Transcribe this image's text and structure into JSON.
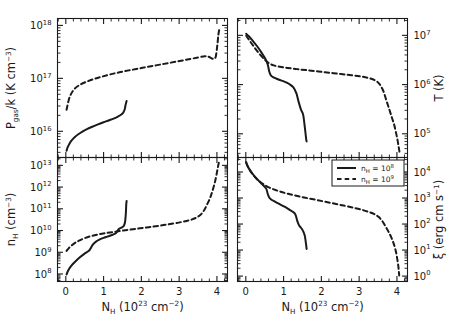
{
  "figure": {
    "title": "",
    "width": 457,
    "height": 332,
    "background": "#ffffff",
    "foreground": "#1a1a1a"
  },
  "legend": {
    "position": "bottom-right-panel-top-right",
    "entries": [
      {
        "style": "solid",
        "label": "n_H = 10^8",
        "label_base": "n",
        "label_sub": "H",
        "label_eq": " = 10",
        "label_exp": "8"
      },
      {
        "style": "dashed",
        "label": "n_H = 10^9",
        "label_base": "n",
        "label_sub": "H",
        "label_eq": " = 10",
        "label_exp": "9"
      }
    ]
  },
  "axes": {
    "x": {
      "label_main": "N",
      "label_sub": "H",
      "label_rest": " (10",
      "label_exp": "23",
      "label_unit": " cm",
      "label_unit_exp": "−2",
      "label_close": ")",
      "label_text": "N_H (10^23 cm^-2)",
      "ticks": [
        "0",
        "1",
        "2",
        "3",
        "4"
      ],
      "values": [
        0,
        1,
        2,
        3,
        4
      ],
      "min": -0.22,
      "max": 4.28,
      "scale": "linear"
    }
  },
  "chart_data": [
    {
      "id": "panel-pressure",
      "type": "line",
      "position": "top-left",
      "title": "",
      "xlabel": "N_H (10^23 cm^-2)",
      "ylabel": "P_gas/k (K cm^-3)",
      "ylabel_parts": {
        "base": "P",
        "sub": "gas",
        "mid": "/k (K cm",
        "exp": "−3",
        "close": ")"
      },
      "yscale": "log",
      "ylim": [
        3200000000000000.0,
        1.35e+18
      ],
      "yticks": [
        1e+16,
        1e+17,
        1e+18
      ],
      "ytick_labels": [
        "10^16",
        "10^17",
        "10^18"
      ],
      "ytick_exps": [
        "16",
        "17",
        "18"
      ],
      "grid": false,
      "series": [
        {
          "name": "n_H = 10^8",
          "style": "solid",
          "x": [
            0.02,
            0.05,
            0.1,
            0.16,
            0.24,
            0.33,
            0.44,
            0.56,
            0.7,
            0.85,
            1.0,
            1.15,
            1.28,
            1.38,
            1.46,
            1.52,
            1.56,
            1.58,
            1.6,
            1.61
          ],
          "y": [
            4300000000000000.0,
            5000000000000000.0,
            5900000000000000.0,
            6800000000000000.0,
            7800000000000000.0,
            8800000000000000.0,
            9900000000000000.0,
            1.1e+16,
            1.22e+16,
            1.35e+16,
            1.48e+16,
            1.62e+16,
            1.76e+16,
            1.9e+16,
            2.05e+16,
            2.25e+16,
            2.6e+16,
            3.1e+16,
            3.55e+16,
            3.75e+16
          ]
        },
        {
          "name": "n_H = 10^9",
          "style": "dashed",
          "x": [
            0.02,
            0.1,
            0.22,
            0.38,
            0.56,
            0.76,
            0.96,
            1.18,
            1.42,
            1.68,
            1.95,
            2.22,
            2.5,
            2.78,
            3.05,
            3.3,
            3.52,
            3.68,
            3.78,
            3.86,
            3.92,
            3.97,
            4.01,
            4.04,
            4.06
          ],
          "y": [
            2.55e+16,
            4.4e+16,
            6.2e+16,
            7.6e+16,
            8.7e+16,
            9.8e+16,
            1.08e+17,
            1.19e+17,
            1.3e+17,
            1.42e+17,
            1.54e+17,
            1.68e+17,
            1.82e+17,
            1.98e+17,
            2.15e+17,
            2.32e+17,
            2.5e+17,
            2.62e+17,
            2.55e+17,
            2.38e+17,
            2.35e+17,
            2.6e+17,
            4.2e+17,
            6.8e+17,
            8.2e+17
          ]
        }
      ]
    },
    {
      "id": "panel-temperature",
      "type": "line",
      "position": "top-right",
      "title": "",
      "xlabel": "N_H (10^23 cm^-2)",
      "ylabel": "T (K)",
      "ylabel_parts": {
        "base": "T (K)"
      },
      "yscale": "log",
      "ylim": [
        33000.0,
        22000000.0
      ],
      "yticks": [
        100000.0,
        1000000.0,
        10000000.0
      ],
      "ytick_labels": [
        "10^5",
        "10^6",
        "10^7"
      ],
      "ytick_exps": [
        "5",
        "6",
        "7"
      ],
      "grid": false,
      "series": [
        {
          "name": "n_H = 10^8",
          "style": "solid",
          "x": [
            0.01,
            0.08,
            0.18,
            0.3,
            0.42,
            0.52,
            0.58,
            0.62,
            0.66,
            0.72,
            0.8,
            0.9,
            1.02,
            1.14,
            1.26,
            1.34,
            1.4,
            1.46,
            1.52,
            1.57,
            1.6,
            1.61
          ],
          "y": [
            10800000.0,
            9600000.0,
            7800000.0,
            6000000.0,
            4400000.0,
            3300000.0,
            2550000.0,
            1850000.0,
            1550000.0,
            1420000.0,
            1330000.0,
            1240000.0,
            1150000.0,
            1040000.0,
            880000.0,
            660000.0,
            440000.0,
            310000.0,
            240000.0,
            120000.0,
            76000.0,
            70000.0
          ]
        },
        {
          "name": "n_H = 10^9",
          "style": "dashed",
          "x": [
            0.01,
            0.1,
            0.22,
            0.36,
            0.5,
            0.62,
            0.74,
            0.9,
            1.1,
            1.35,
            1.62,
            1.92,
            2.22,
            2.52,
            2.8,
            3.05,
            3.25,
            3.42,
            3.54,
            3.64,
            3.72,
            3.8,
            3.87,
            3.93,
            3.98,
            4.02,
            4.05,
            4.07
          ],
          "y": [
            9800000.0,
            7800000.0,
            5800000.0,
            4200000.0,
            3200000.0,
            2700000.0,
            2450000.0,
            2300000.0,
            2180000.0,
            2060000.0,
            1960000.0,
            1850000.0,
            1740000.0,
            1640000.0,
            1550000.0,
            1460000.0,
            1360000.0,
            1220000.0,
            1020000.0,
            740000.0,
            480000.0,
            310000.0,
            210000.0,
            150000.0,
            102000.0,
            72000.0,
            52000.0,
            42000.0
          ]
        }
      ]
    },
    {
      "id": "panel-density",
      "type": "line",
      "position": "bottom-left",
      "title": "",
      "xlabel": "N_H (10^23 cm^-2)",
      "ylabel": "n_H (cm^-3)",
      "ylabel_parts": {
        "base": "n",
        "sub": "H",
        "mid": " (cm",
        "exp": "−3",
        "close": ")"
      },
      "yscale": "log",
      "ylim": [
        45000000.0,
        23000000000000.0
      ],
      "yticks": [
        100000000.0,
        1000000000.0,
        10000000000.0,
        100000000000.0,
        1000000000000.0,
        10000000000000.0
      ],
      "ytick_labels": [
        "10^8",
        "10^9",
        "10^10",
        "10^11",
        "10^12",
        "10^13"
      ],
      "ytick_exps": [
        "8",
        "9",
        "10",
        "11",
        "12",
        "13"
      ],
      "grid": false,
      "series": [
        {
          "name": "n_H = 10^8",
          "style": "solid",
          "x": [
            0.02,
            0.05,
            0.1,
            0.18,
            0.28,
            0.38,
            0.48,
            0.56,
            0.62,
            0.66,
            0.72,
            0.8,
            0.9,
            1.0,
            1.12,
            1.24,
            1.33,
            1.38,
            1.42,
            1.46,
            1.5,
            1.54,
            1.57,
            1.59,
            1.6,
            1.61
          ],
          "y": [
            95000000.0,
            130000000.0,
            185000000.0,
            280000000.0,
            420000000.0,
            600000000.0,
            820000000.0,
            1020000000.0,
            1200000000.0,
            1550000000.0,
            2300000000.0,
            3100000000.0,
            3900000000.0,
            4600000000.0,
            5400000000.0,
            6400000000.0,
            7600000000.0,
            10500000000.0,
            12200000000.0,
            13200000000.0,
            14500000000.0,
            17000000000.0,
            26000000000.0,
            65000000000.0,
            160000000000.0,
            230000000000.0
          ]
        },
        {
          "name": "n_H = 10^9",
          "style": "dashed",
          "x": [
            0.02,
            0.08,
            0.16,
            0.26,
            0.38,
            0.52,
            0.68,
            0.86,
            1.06,
            1.28,
            1.52,
            1.78,
            2.05,
            2.32,
            2.58,
            2.84,
            3.08,
            3.28,
            3.44,
            3.56,
            3.66,
            3.74,
            3.82,
            3.88,
            3.94,
            3.99,
            4.03,
            4.06
          ],
          "y": [
            1150000000.0,
            1550000000.0,
            2100000000.0,
            2800000000.0,
            3600000000.0,
            4600000000.0,
            5600000000.0,
            6600000000.0,
            7600000000.0,
            8700000000.0,
            10000000000.0,
            11500000000.0,
            13200000000.0,
            15200000000.0,
            17800000000.0,
            21000000000.0,
            25000000000.0,
            30000000000.0,
            38000000000.0,
            52000000000.0,
            85000000000.0,
            160000000000.0,
            320000000000.0,
            650000000000.0,
            1500000000000.0,
            3800000000000.0,
            9000000000000.0,
            16000000000000.0
          ]
        }
      ]
    },
    {
      "id": "panel-ionization",
      "type": "line",
      "position": "bottom-right",
      "title": "",
      "xlabel": "N_H (10^23 cm^-2)",
      "ylabel": "ξ (erg cm s^-1)",
      "ylabel_parts": {
        "base": "ξ (erg cm s",
        "exp": "−1",
        "close": ")"
      },
      "yscale": "log",
      "ylim": [
        0.62,
        36000.0
      ],
      "yticks": [
        1,
        10,
        100,
        1000,
        10000
      ],
      "ytick_labels": [
        "10^0",
        "10^1",
        "10^2",
        "10^3",
        "10^4"
      ],
      "ytick_exps": [
        "0",
        "1",
        "2",
        "3",
        "4"
      ],
      "grid": false,
      "series": [
        {
          "name": "n_H = 10^8",
          "style": "solid",
          "x": [
            0.01,
            0.06,
            0.14,
            0.24,
            0.36,
            0.46,
            0.54,
            0.58,
            0.62,
            0.68,
            0.76,
            0.86,
            0.98,
            1.1,
            1.22,
            1.31,
            1.36,
            1.4,
            1.44,
            1.48,
            1.52,
            1.56,
            1.58,
            1.6,
            1.61
          ],
          "y": [
            24000.0,
            15500.0,
            10200.0,
            6600.0,
            4300.0,
            3100.0,
            2300.0,
            1450.0,
            1050.0,
            860.0,
            740.0,
            620.0,
            500.0,
            400.0,
            310.0,
            240.0,
            135.0,
            95.0,
            78.0,
            66.0,
            52.0,
            36.0,
            24.0,
            14.5,
            11.0
          ]
        },
        {
          "name": "n_H = 10^9",
          "style": "dashed",
          "x": [
            0.01,
            0.08,
            0.18,
            0.3,
            0.44,
            0.58,
            0.74,
            0.92,
            1.12,
            1.34,
            1.58,
            1.84,
            2.1,
            2.36,
            2.62,
            2.86,
            3.08,
            3.26,
            3.4,
            3.52,
            3.62,
            3.7,
            3.78,
            3.85,
            3.91,
            3.96,
            4.0,
            4.04,
            4.06
          ],
          "y": [
            22000.0,
            13500.0,
            8200.0,
            5200.0,
            3600.0,
            2700.0,
            2150.0,
            1750.0,
            1450.0,
            1220.0,
            1020.0,
            860.0,
            720.0,
            600.0,
            500.0,
            420.0,
            350.0,
            290.0,
            240.0,
            185.0,
            125.0,
            80.0,
            50.0,
            31.0,
            18.5,
            10.5,
            5.5,
            2.2,
            1.05
          ]
        }
      ]
    }
  ]
}
